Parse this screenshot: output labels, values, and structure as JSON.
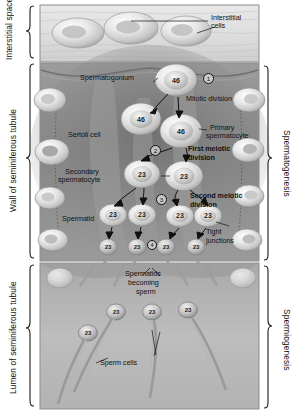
{
  "figure": {
    "kind": "histology-diagram",
    "palette": {
      "interstitial_tissue": "#d9d9d9",
      "tubule_wall": "#8f8f8f",
      "tubule_wall_dark": "#6f6f6f",
      "lumen": "#b8b8b8",
      "cell_fill": "#e2e2e2",
      "cell_rim": "#7d7d7d",
      "frame": "#8d8d8d",
      "ink": "#111111"
    }
  },
  "left_labels": [
    {
      "text": "Interstitial\nspace",
      "name": "interstitial-space"
    },
    {
      "text": "Wall of seminiferous tubule",
      "name": "wall-of-seminiferous-tubule"
    },
    {
      "text": "Lumen of seminiferous tubule",
      "name": "lumen-of-seminiferous-tubule"
    }
  ],
  "left_label_text": {
    "interstitial_space": "Interstitial space",
    "wall": "Wall of seminiferous tubule",
    "lumen": "Lumen of seminiferous tubule"
  },
  "right_label_text": {
    "spermatogenesis": "Spermatogenesis",
    "spermiogenesis": "Spermiogenesis"
  },
  "callouts": {
    "interstitial_cells": "Interstitial\ncells",
    "interstitial_cells_l1": "Interstitial",
    "interstitial_cells_l2": "cells",
    "spermatogonium": "Spermatogonium",
    "mitotic_division": "Mitotic division",
    "primary_spermatocyte_l1": "Primary",
    "primary_spermatocyte_l2": "spermatocyte",
    "sertoli_cell": "Sertoli cell",
    "first_meiotic_l1": "First meiotic",
    "first_meiotic_l2": "division",
    "secondary_spermatocyte_l1": "Secondary",
    "secondary_spermatocyte_l2": "spermatocyte",
    "second_meiotic_l1": "Second meiotic",
    "second_meiotic_l2": "division",
    "spermatid": "Spermatid",
    "tight_junctions_l1": "Tight",
    "tight_junctions_l2": "junctions",
    "spermatids_becoming_sperm_l1": "Spermatids",
    "spermatids_becoming_sperm_l2": "becoming",
    "spermatids_becoming_sperm_l3": "sperm",
    "sperm_cells": "Sperm cells"
  },
  "step_markers": [
    {
      "id": "1",
      "label": "1",
      "meaning": "Mitotic division"
    },
    {
      "id": "2",
      "label": "2",
      "meaning": "First meiotic division"
    },
    {
      "id": "3",
      "label": "3",
      "meaning": "Second meiotic division"
    },
    {
      "id": "4",
      "label": "4",
      "meaning": "Spermiogenesis"
    }
  ],
  "chromosome_counts": {
    "spermatogonium": "46",
    "primary_spermatocyte": "46",
    "secondary_spermatocyte": "23",
    "spermatid": "23",
    "sperm": "23"
  },
  "cells": {
    "diploid_46": [
      {
        "name": "spermatogonium-dividing",
        "value": "46"
      },
      {
        "name": "spermatogonium-daughter",
        "value": "46"
      },
      {
        "name": "primary-spermatocyte",
        "value": "46"
      }
    ],
    "secondary_spermatocytes_23": [
      {
        "name": "secondary-spermatocyte-left",
        "value": "23"
      },
      {
        "name": "secondary-spermatocyte-right",
        "value": "23"
      }
    ],
    "spermatids_23": [
      {
        "name": "spermatid-1",
        "value": "23"
      },
      {
        "name": "spermatid-2",
        "value": "23"
      },
      {
        "name": "spermatid-3",
        "value": "23"
      },
      {
        "name": "spermatid-4",
        "value": "23"
      }
    ],
    "early_sperm_23": [
      {
        "name": "early-sperm-1",
        "value": "23"
      },
      {
        "name": "early-sperm-2",
        "value": "23"
      },
      {
        "name": "early-sperm-3",
        "value": "23"
      },
      {
        "name": "early-sperm-4",
        "value": "23"
      }
    ],
    "sperm_cells_23": [
      {
        "name": "sperm-cell-1",
        "value": "23"
      },
      {
        "name": "sperm-cell-2",
        "value": "23"
      },
      {
        "name": "sperm-cell-3",
        "value": "23"
      },
      {
        "name": "sperm-cell-4",
        "value": "23"
      }
    ]
  }
}
